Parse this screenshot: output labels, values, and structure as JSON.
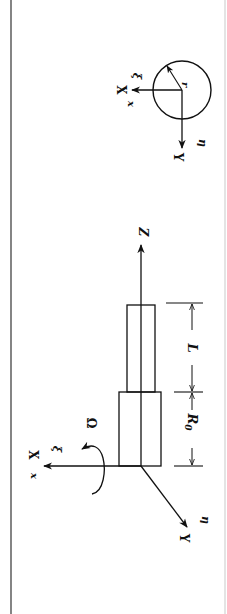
{
  "figure": {
    "orientation": "rotated-90-clockwise",
    "colors": {
      "ink": "#111111",
      "background": "#ffffff",
      "border": "#333333"
    }
  },
  "main_view": {
    "axis_labels": {
      "z_axis": "Z",
      "x_axis_upper": "X",
      "x_axis_lower": "x",
      "xi": "ξ",
      "y_axis": "Y",
      "eta": "η",
      "rotation": "Ω"
    },
    "dimensions": {
      "base_radius_label": "R",
      "base_radius_subscript": "0",
      "length_label": "L"
    }
  },
  "cross_section_view": {
    "axis_labels": {
      "x_axis_upper": "X",
      "x_axis_lower": "x",
      "xi": "ξ",
      "y_axis": "Y",
      "eta": "η",
      "radius": "r"
    }
  }
}
